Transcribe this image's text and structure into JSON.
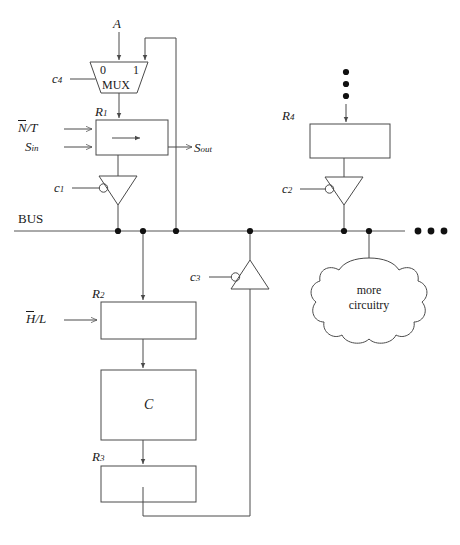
{
  "diagram": {
    "title_visible": false,
    "bus_label": "BUS",
    "ellipsis_right": "• • •",
    "vertical_dots": "⋮",
    "signals": {
      "a_input": "A",
      "c4": "c",
      "c4_sub": "4",
      "c1": "c",
      "c1_sub": "1",
      "c2": "c",
      "c2_sub": "2",
      "c3": "c",
      "c3_sub": "3",
      "n_t_pre": "N",
      "n_t_post": "/T",
      "s_in": "S",
      "s_in_sub": "in",
      "s_out": "S",
      "s_out_sub": "out",
      "h_l_pre": "H",
      "h_l_post": "/L"
    },
    "blocks": [
      {
        "name": "mux",
        "label": "MUX",
        "input0": "0",
        "input1": "1"
      },
      {
        "name": "r1",
        "label": "R",
        "sub": "1"
      },
      {
        "name": "r4",
        "label": "R",
        "sub": "4"
      },
      {
        "name": "r2",
        "label": "R",
        "sub": "2"
      },
      {
        "name": "c_block",
        "label": "C",
        "sub": ""
      },
      {
        "name": "r3",
        "label": "R",
        "sub": "3"
      }
    ],
    "cloud": {
      "line1": "more",
      "line2": "circuitry"
    },
    "colors": {
      "line": "#4a4a4a",
      "text": "#1a1a1a",
      "bus": "#555555",
      "node": "#111111",
      "background": "#ffffff"
    }
  }
}
